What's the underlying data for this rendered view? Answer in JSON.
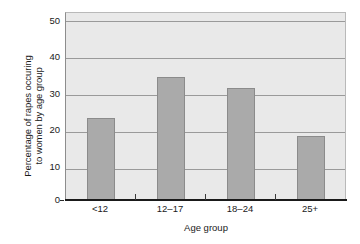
{
  "chart_data": {
    "type": "bar",
    "title": "",
    "categories": [
      "<12",
      "12–17",
      "18–24",
      "25+"
    ],
    "values": [
      22,
      33,
      30,
      17
    ],
    "series": [
      {
        "name": "Percentage of rapes occuring to women by age group",
        "values": [
          22,
          33,
          30,
          17
        ]
      }
    ],
    "xlabel": "Age group",
    "ylabel": "Percentage of rapes occuring to women by age group",
    "ylabel_line1": "Percentage of rapes occuring",
    "ylabel_line2": "to women by age group",
    "ylim": [
      0,
      50
    ],
    "yticks": [
      0,
      10,
      20,
      30,
      40,
      50
    ],
    "ytick_labels": [
      "0",
      "10",
      "20",
      "30",
      "40",
      "50"
    ],
    "grid": true,
    "grid_axis": "y",
    "legend": false,
    "legend_position": "none",
    "colors": {
      "bar_fill": "#aaaaaa",
      "bar_border": "#8b8b8b",
      "plot_background": "#e9e9e9",
      "gridline": "#9a9a9a",
      "axis": "#1a1a1a",
      "text": "#1a1a1a",
      "page_background": "#ffffff"
    }
  }
}
